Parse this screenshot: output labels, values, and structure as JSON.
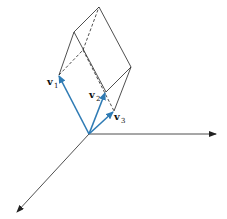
{
  "figure": {
    "vectors": [
      {
        "name": "v",
        "subscript": "1",
        "color": "#2f7bb4"
      },
      {
        "name": "v",
        "subscript": "2",
        "color": "#2f7bb4"
      },
      {
        "name": "v",
        "subscript": "3",
        "color": "#2f7bb4"
      }
    ],
    "edge_color": "#222222",
    "axis_color": "#222222"
  }
}
